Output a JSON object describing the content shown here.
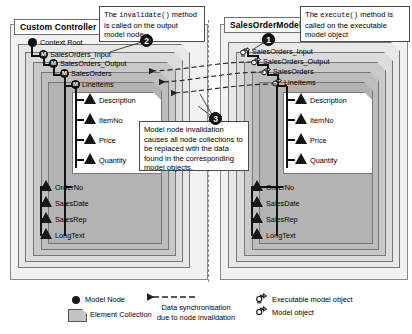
{
  "diagram": {
    "panels": [
      {
        "id": "custom-controller",
        "title": "Custom Controller",
        "root_label": "Context Root",
        "nodes": [
          {
            "label": "SalesOrders_Input",
            "type": "model-node"
          },
          {
            "label": "SalesOrders_Output",
            "type": "model-node"
          },
          {
            "label": "SalesOrders",
            "type": "model-node"
          },
          {
            "label": "LineItems",
            "type": "model-node"
          }
        ],
        "line_item_attributes": [
          "Description",
          "ItemNo",
          "Price",
          "Quantity"
        ],
        "sales_order_attributes": [
          "OrderNo",
          "SalesDate",
          "SalesRep",
          "LongText"
        ]
      },
      {
        "id": "sales-order-model",
        "title": "SalesOrderModel",
        "root_label": "",
        "nodes": [
          {
            "label": "SalesOrders_Input",
            "type": "executable-model-object"
          },
          {
            "label": "SalesOrders_Output",
            "type": "model-object"
          },
          {
            "label": "SalesOrders",
            "type": "model-object"
          },
          {
            "label": "LineItems",
            "type": "model-object"
          }
        ],
        "line_item_attributes": [
          "Description",
          "ItemNo",
          "Price",
          "Quantity"
        ],
        "sales_order_attributes": [
          "OrderNo",
          "SalesDate",
          "SalesRep",
          "LongText"
        ]
      }
    ],
    "callouts": [
      {
        "number": "1",
        "parts": [
          {
            "text": "The ",
            "mono": false
          },
          {
            "text": "execute()",
            "mono": true
          },
          {
            "text": " method is called on the executable model object",
            "mono": false
          }
        ],
        "plain": "The execute() method is called on the executable model object"
      },
      {
        "number": "2",
        "parts": [
          {
            "text": "The ",
            "mono": false
          },
          {
            "text": "invalidate()",
            "mono": true
          },
          {
            "text": " method is called on the output model node",
            "mono": false
          }
        ],
        "plain": "The invalidate() method is called on the output model node"
      },
      {
        "number": "3",
        "parts": [
          {
            "text": "Model node invalidation causes all node collections to be replaced with the data found in the corresponding model objects.",
            "mono": false
          }
        ],
        "plain": "Model node invalidation causes all node collections to be replaced with the data found in the corresponding model objects."
      }
    ],
    "legend": [
      {
        "id": "model-node",
        "label": "Model Node",
        "glyph": "filled-circle-icon"
      },
      {
        "id": "element-collection",
        "label": "Element Collection",
        "glyph": "folded-box-icon"
      },
      {
        "id": "data-sync",
        "label": "Data synchronisation\ndue to node invalidation",
        "line1": "Data synchronisation",
        "line2": "due to node invalidation",
        "glyph": "dashed-arrow-icon"
      },
      {
        "id": "executable-model-object",
        "label": "Executable model object",
        "glyph": "thumb-up-icon"
      },
      {
        "id": "model-object",
        "label": "Model object",
        "glyph": "thumb-down-icon"
      }
    ],
    "colors": {
      "panel_fill": "#f2f2f2",
      "collection_light": "#e8e8e8",
      "collection_mid": "#c9c9c9",
      "collection_dark": "#b3b3b3",
      "node_fill": "#1b1b1b",
      "callout_border": "#4a4a4a"
    }
  }
}
